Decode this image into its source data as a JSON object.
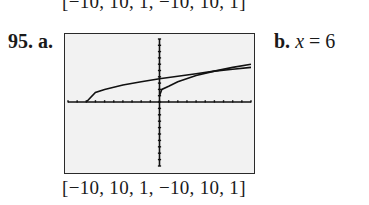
{
  "problem": {
    "previous_window": "[−10, 10, 1, −10, 10, 1]",
    "number": "95.",
    "part_a_label": "a.",
    "part_b_label": "b.",
    "part_b_answer_var": "x",
    "part_b_answer_eq": " = 6",
    "window": "[−10, 10, 1, −10, 10, 1]"
  },
  "chart_data": {
    "type": "line",
    "title": "",
    "xlabel": "",
    "ylabel": "",
    "xlim": [
      -10,
      10
    ],
    "ylim": [
      -10,
      10
    ],
    "xscl": 1,
    "yscl": 1,
    "grid": false,
    "series": [
      {
        "name": "curve-1",
        "x": [
          -8,
          -7,
          -6,
          -4,
          -2,
          0,
          2,
          4,
          6,
          8,
          10
        ],
        "y": [
          0,
          1.5,
          2.0,
          2.7,
          3.2,
          3.7,
          4.1,
          4.5,
          4.9,
          5.2,
          5.5
        ]
      },
      {
        "name": "curve-2",
        "x": [
          0,
          0.25,
          1,
          2,
          4,
          6,
          8,
          10
        ],
        "y": [
          1,
          2.0,
          2.5,
          3.2,
          4.2,
          4.9,
          5.5,
          6.0
        ]
      }
    ],
    "annotations": [
      "Intersection at x = 6"
    ]
  }
}
